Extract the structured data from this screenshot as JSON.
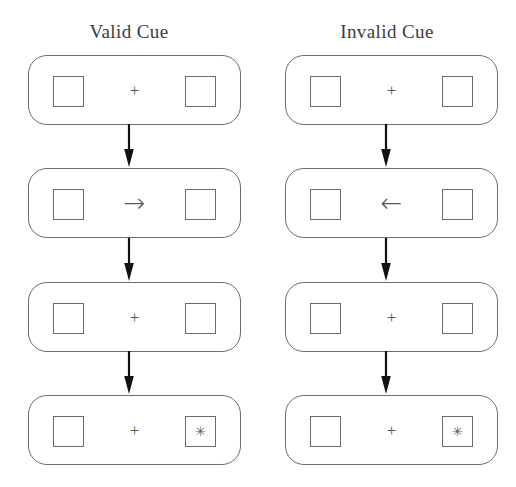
{
  "figure": {
    "background_color": "#ffffff",
    "stroke_color": "#6e6c6d",
    "arrow_color": "#111111",
    "text_color": "#3d3b3c"
  },
  "columns": [
    {
      "id": "valid-cue",
      "title": "Valid Cue",
      "panels": [
        {
          "id": "valid-fixation-1",
          "left_box": "",
          "center": "+",
          "center_type": "fixation",
          "right_box": ""
        },
        {
          "id": "valid-cue-arrow",
          "left_box": "",
          "center": "→",
          "center_type": "cue",
          "right_box": ""
        },
        {
          "id": "valid-fixation-2",
          "left_box": "",
          "center": "+",
          "center_type": "fixation",
          "right_box": ""
        },
        {
          "id": "valid-target",
          "left_box": "",
          "center": "+",
          "center_type": "fixation",
          "right_box": "✳"
        }
      ]
    },
    {
      "id": "invalid-cue",
      "title": "Invalid Cue",
      "panels": [
        {
          "id": "invalid-fixation-1",
          "left_box": "",
          "center": "+",
          "center_type": "fixation",
          "right_box": ""
        },
        {
          "id": "invalid-cue-arrow",
          "left_box": "",
          "center": "←",
          "center_type": "cue",
          "right_box": ""
        },
        {
          "id": "invalid-fixation-2",
          "left_box": "",
          "center": "+",
          "center_type": "fixation",
          "right_box": ""
        },
        {
          "id": "invalid-target",
          "left_box": "",
          "center": "+",
          "center_type": "fixation",
          "right_box": "✳"
        }
      ]
    }
  ]
}
